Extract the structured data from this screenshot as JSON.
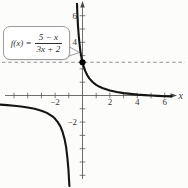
{
  "figure": {
    "formula": {
      "lhs": "f(x) =",
      "numerator": "5 − x",
      "denominator": "3x + 2"
    }
  },
  "chart_data": {
    "type": "line",
    "title": "",
    "function": "f(x) = (5 − x) / (3x + 2)",
    "xlabel": "x",
    "ylabel": "",
    "xlim": [
      -6.2,
      6.8
    ],
    "ylim": [
      -7,
      7.1
    ],
    "grid": false,
    "x_ticks": [
      -5,
      -4,
      -3,
      -2,
      -1,
      1,
      2,
      3,
      4,
      5,
      6
    ],
    "y_ticks": [
      -6,
      -5,
      -4,
      -3,
      -2,
      -1,
      1,
      2,
      3,
      4,
      5,
      6
    ],
    "x_tick_labels": [
      {
        "value": -2,
        "label": "−2"
      },
      {
        "value": 2,
        "label": "2"
      },
      {
        "value": 4,
        "label": "4"
      },
      {
        "value": 6,
        "label": "6"
      }
    ],
    "y_tick_labels": [
      {
        "value": 6,
        "label": "6"
      },
      {
        "value": 4,
        "label": "4"
      },
      {
        "value": -2,
        "label": "−2"
      }
    ],
    "vertical_asymptote_x": -0.667,
    "dashed_horizontal_line_y": 2.5,
    "marked_point": {
      "x": 0,
      "y": 2.5
    },
    "series": [
      {
        "name": "left-branch",
        "points": [
          [
            -6.2,
            -0.675
          ],
          [
            -5.5,
            -0.724
          ],
          [
            -5,
            -0.769
          ],
          [
            -4.5,
            -0.826
          ],
          [
            -4,
            -0.9
          ],
          [
            -3.5,
            -1.0
          ],
          [
            -3,
            -1.143
          ],
          [
            -2.6,
            -1.31
          ],
          [
            -2.2,
            -1.565
          ],
          [
            -2,
            -1.75
          ],
          [
            -1.8,
            -2.0
          ],
          [
            -1.6,
            -2.357
          ],
          [
            -1.45,
            -2.745
          ],
          [
            -1.3,
            -3.316
          ],
          [
            -1.2,
            -3.875
          ],
          [
            -1.1,
            -4.692
          ],
          [
            -1.03,
            -5.532
          ],
          [
            -0.97,
            -6.56
          ],
          [
            -0.959,
            -6.8
          ]
        ]
      },
      {
        "name": "right-branch",
        "points": [
          [
            -0.404,
            6.9
          ],
          [
            -0.38,
            6.256
          ],
          [
            -0.35,
            5.632
          ],
          [
            -0.32,
            5.115
          ],
          [
            -0.28,
            4.552
          ],
          [
            -0.24,
            4.094
          ],
          [
            -0.2,
            3.714
          ],
          [
            -0.15,
            3.323
          ],
          [
            -0.1,
            3.0
          ],
          [
            -0.05,
            2.73
          ],
          [
            0,
            2.5
          ],
          [
            0.1,
            2.13
          ],
          [
            0.2,
            1.846
          ],
          [
            0.35,
            1.525
          ],
          [
            0.5,
            1.286
          ],
          [
            0.75,
            1.0
          ],
          [
            1,
            0.8
          ],
          [
            1.25,
            0.652
          ],
          [
            1.5,
            0.538
          ],
          [
            2,
            0.375
          ],
          [
            2.5,
            0.263
          ],
          [
            3,
            0.182
          ],
          [
            3.5,
            0.12
          ],
          [
            4,
            0.071
          ],
          [
            4.5,
            0.032
          ],
          [
            5,
            0
          ],
          [
            5.5,
            -0.027
          ],
          [
            6,
            -0.05
          ],
          [
            6.5,
            -0.07
          ]
        ]
      }
    ],
    "colors": {
      "curve": "#141414",
      "axis": "#4a4a4a",
      "dashed_line": "#909090",
      "point": "#000000",
      "label": "#3a3a3a",
      "callout_border": "#9d9d9d"
    }
  }
}
